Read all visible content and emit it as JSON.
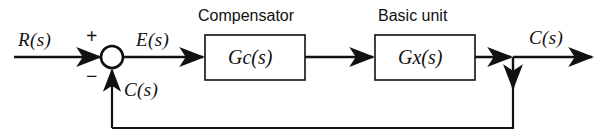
{
  "diagram": {
    "type": "control-system-block-diagram",
    "background_color": "#ffffff",
    "line_color": "#111111",
    "signals": {
      "input_label": "R(s)",
      "error_label": "E(s)",
      "output_label": "C(s)",
      "feedback_label": "C(s)"
    },
    "summing_junction": {
      "name": "summing-junction",
      "positive_sign": "+",
      "negative_sign": "−",
      "center_x": 112,
      "center_y": 57,
      "radius": 11
    },
    "blocks": [
      {
        "id": "compensator",
        "title": "Compensator",
        "expression_main": "G",
        "expression_sub": "c",
        "expression_tail": "(s)",
        "x": 205,
        "y": 35,
        "width": 100,
        "height": 45
      },
      {
        "id": "basic-unit",
        "title": "Basic unit",
        "expression_main": "G",
        "expression_sub": "x",
        "expression_tail": "(s)",
        "x": 375,
        "y": 35,
        "width": 100,
        "height": 45
      }
    ],
    "takeoff_point": {
      "name": "output-takeoff-point",
      "x": 513,
      "y": 57
    },
    "feedback_path": {
      "bottom_y": 128,
      "left_x": 112,
      "right_x": 513
    }
  }
}
